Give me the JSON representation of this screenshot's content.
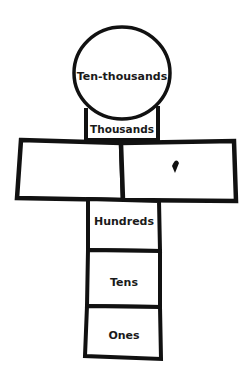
{
  "diagram": {
    "type": "place-value-hopscotch",
    "shapes": {
      "ten_thousands": {
        "label": "Ten-thousands"
      },
      "thousands": {
        "label": "Thousands"
      },
      "left_box": {
        "label": ""
      },
      "right_box": {
        "label": "",
        "mark": ","
      },
      "hundreds": {
        "label": "Hundreds"
      },
      "tens": {
        "label": "Tens"
      },
      "ones": {
        "label": "Ones"
      }
    },
    "colors": {
      "stroke": "#111111",
      "fill": "#ffffff",
      "text": "#1a1a1a"
    }
  }
}
